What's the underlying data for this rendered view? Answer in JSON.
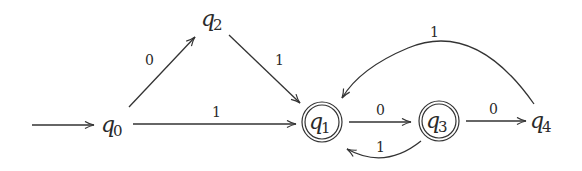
{
  "diagram": {
    "type": "DFA",
    "states": [
      {
        "id": "q0",
        "label": "q",
        "sub": "0",
        "start": true,
        "accepting": false
      },
      {
        "id": "q1",
        "label": "q",
        "sub": "1",
        "start": false,
        "accepting": true
      },
      {
        "id": "q2",
        "label": "q",
        "sub": "2",
        "start": false,
        "accepting": false
      },
      {
        "id": "q3",
        "label": "q",
        "sub": "3",
        "start": false,
        "accepting": true
      },
      {
        "id": "q4",
        "label": "q",
        "sub": "4",
        "start": false,
        "accepting": false
      }
    ],
    "transitions": [
      {
        "from": "q0",
        "to": "q2",
        "symbol": "0"
      },
      {
        "from": "q0",
        "to": "q1",
        "symbol": "1"
      },
      {
        "from": "q2",
        "to": "q1",
        "symbol": "1"
      },
      {
        "from": "q1",
        "to": "q3",
        "symbol": "0"
      },
      {
        "from": "q3",
        "to": "q1",
        "symbol": "1"
      },
      {
        "from": "q3",
        "to": "q4",
        "symbol": "0"
      },
      {
        "from": "q4",
        "to": "q1",
        "symbol": "1"
      }
    ],
    "colors": {
      "stroke": "#333333",
      "text": "#2a2a2a",
      "background": "#ffffff"
    }
  }
}
